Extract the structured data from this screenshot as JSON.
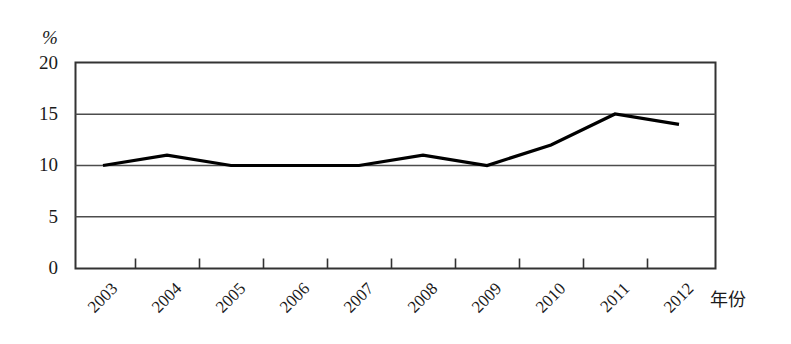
{
  "chart_data": {
    "type": "line",
    "title": "",
    "subtitle": "",
    "xlabel": "年份",
    "ylabel": "%",
    "categories": [
      "2003",
      "2004",
      "2005",
      "2006",
      "2007",
      "2008",
      "2009",
      "2010",
      "2011",
      "2012"
    ],
    "values": [
      10,
      11,
      10,
      10,
      10,
      11,
      10,
      12,
      15,
      14
    ],
    "series": [
      {
        "name": "",
        "values": [
          10,
          11,
          10,
          10,
          10,
          11,
          10,
          12,
          15,
          14
        ]
      }
    ],
    "ylim": [
      0,
      20
    ],
    "yticks": [
      0,
      5,
      10,
      15,
      20
    ],
    "ytick_labels": [
      "0",
      "5",
      "10",
      "15",
      "20"
    ],
    "grid": true,
    "grid_axis": "y",
    "legend": "none",
    "line_color": "#000000",
    "grid_color": "#555555",
    "frame_color": "#333333",
    "background": "#ffffff",
    "xtick_rotation": -45
  },
  "axes": {
    "unit_label": "%",
    "x_axis_title": "年份"
  }
}
